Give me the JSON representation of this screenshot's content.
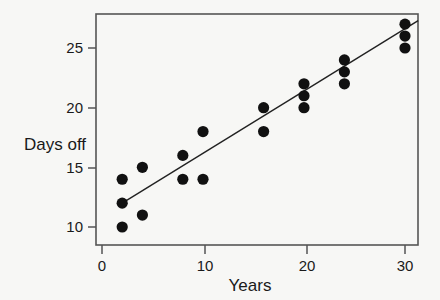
{
  "chart_data": {
    "type": "scatter",
    "title": "",
    "xlabel": "Years",
    "ylabel": "Days off",
    "xlim": [
      -0.6,
      31.3
    ],
    "ylim": [
      8.6,
      27.9
    ],
    "xticks": [
      0,
      10,
      20,
      30
    ],
    "xtick_labels": [
      "0",
      "10",
      "20",
      "30"
    ],
    "yticks": [
      10,
      15,
      20,
      25
    ],
    "ytick_labels": [
      "10",
      "15",
      "20",
      "25"
    ],
    "grid": false,
    "legend": null,
    "points": [
      {
        "x": 2,
        "y": 14
      },
      {
        "x": 2,
        "y": 12
      },
      {
        "x": 2,
        "y": 10
      },
      {
        "x": 4,
        "y": 15
      },
      {
        "x": 4,
        "y": 11
      },
      {
        "x": 8,
        "y": 16
      },
      {
        "x": 8,
        "y": 14
      },
      {
        "x": 10,
        "y": 18
      },
      {
        "x": 10,
        "y": 14
      },
      {
        "x": 16,
        "y": 20
      },
      {
        "x": 16,
        "y": 18
      },
      {
        "x": 20,
        "y": 22
      },
      {
        "x": 20,
        "y": 21
      },
      {
        "x": 20,
        "y": 20
      },
      {
        "x": 24,
        "y": 24
      },
      {
        "x": 24,
        "y": 23
      },
      {
        "x": 24,
        "y": 22
      },
      {
        "x": 30,
        "y": 27
      },
      {
        "x": 30,
        "y": 26
      },
      {
        "x": 30,
        "y": 25
      }
    ],
    "marker": {
      "shape": "circle",
      "size": 5.6,
      "color": "#111111"
    },
    "trend_line": {
      "type": "linear-fit",
      "x_start": 2,
      "y_start": 12,
      "x_end": 31.3,
      "y_end": 27.3,
      "color": "#222222"
    },
    "colors": {
      "background": "#f7f7f5",
      "frame": "#555555",
      "text": "#1a1a1a",
      "marker": "#111111",
      "line": "#222222"
    }
  }
}
